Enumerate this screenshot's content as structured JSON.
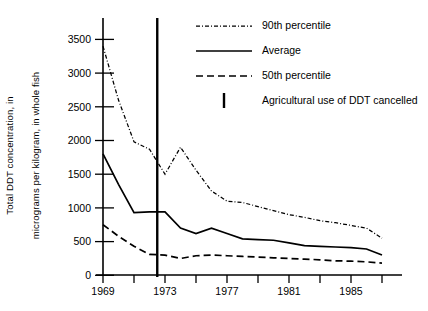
{
  "chart_data": {
    "type": "line",
    "title": "",
    "xlabel": "",
    "ylabel": "Total DDT concentration, in micrograms per kilogram, in whole fish",
    "ylabel_line1": "Total DDT concentration, in",
    "ylabel_line2": "micrograms per kilogram, in whole fish",
    "xlim": [
      1968.5,
      1987.6
    ],
    "ylim": [
      0,
      3700
    ],
    "grid": false,
    "legend_position": "top-right",
    "ytick_labels": [
      "0",
      "500",
      "1000",
      "1500",
      "2000",
      "2500",
      "3000",
      "3500"
    ],
    "ytick_values": [
      0,
      500,
      1000,
      1500,
      2000,
      2500,
      3000,
      3500
    ],
    "xtick_values": [
      1969,
      1971,
      1973,
      1975,
      1977,
      1979,
      1981,
      1983,
      1985,
      1987
    ],
    "xtick_labels": [
      "1969",
      "",
      "1973",
      "",
      "1977",
      "",
      "1981",
      "",
      "1985",
      ""
    ],
    "xtick_labeled": [
      {
        "value": 1969,
        "label": "1969"
      },
      {
        "value": 1973,
        "label": "1973"
      },
      {
        "value": 1977,
        "label": "1977"
      },
      {
        "value": 1981,
        "label": "1981"
      },
      {
        "value": 1985,
        "label": "1985"
      }
    ],
    "x": [
      1969,
      1970,
      1971,
      1972,
      1973,
      1974,
      1975,
      1976,
      1977,
      1978,
      1979,
      1980,
      1981,
      1982,
      1983,
      1984,
      1985,
      1986,
      1987
    ],
    "series": [
      {
        "name": "90th percentile",
        "style": "dash-dot",
        "values": [
          3400,
          2600,
          1980,
          1870,
          1500,
          1900,
          1560,
          1250,
          1100,
          1080,
          1020,
          960,
          900,
          860,
          810,
          780,
          740,
          700,
          550
        ]
      },
      {
        "name": "Average",
        "style": "solid",
        "values": [
          1800,
          1350,
          930,
          940,
          940,
          700,
          620,
          700,
          620,
          540,
          530,
          520,
          480,
          440,
          430,
          420,
          410,
          390,
          300
        ]
      },
      {
        "name": "50th percentile",
        "style": "dashed",
        "values": [
          750,
          580,
          430,
          310,
          300,
          250,
          290,
          300,
          290,
          280,
          270,
          260,
          250,
          240,
          230,
          215,
          210,
          200,
          180
        ]
      }
    ],
    "annotations": [
      {
        "name": "Agricultural use of DDT cancelled",
        "type": "vertical-line",
        "x": 1972.5
      }
    ],
    "legend_entries": [
      {
        "label": "90th percentile",
        "marker": "dash-dot-line"
      },
      {
        "label": "Average",
        "marker": "solid-line"
      },
      {
        "label": "50th percentile",
        "marker": "dashed-line"
      },
      {
        "label": "Agricultural use of DDT cancelled",
        "marker": "vertical-bar"
      }
    ]
  }
}
